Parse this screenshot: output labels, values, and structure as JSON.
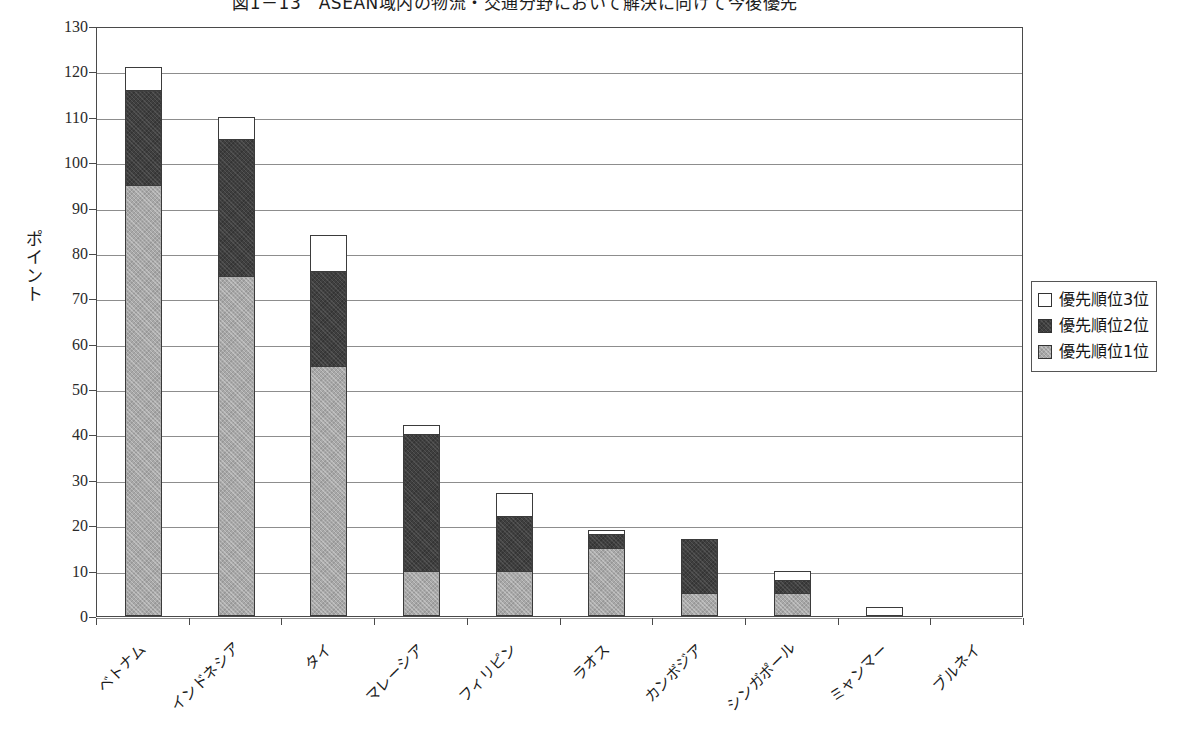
{
  "chart_data": {
    "type": "bar",
    "subtype": "stacked-bar",
    "title": "図1－13　ASEAN域内の物流・交通分野において解決に向けて今後優先",
    "ylabel": "ポイント",
    "xlabel": "",
    "ylim": [
      0,
      130
    ],
    "ytick_step": 10,
    "ytick_labels": [
      "130",
      "120",
      "110",
      "100",
      "90",
      "80",
      "70",
      "60",
      "50",
      "40",
      "30",
      "20",
      "10",
      "0"
    ],
    "grid": true,
    "legend_position": "right",
    "categories": [
      "ベトナム",
      "インドネシア",
      "タイ",
      "マレーシア",
      "フィリピン",
      "ラオス",
      "カンボジア",
      "シンガポール",
      "ミャンマー",
      "ブルネイ"
    ],
    "series": [
      {
        "name": "優先順位1位",
        "color": "#a8a8a8",
        "values": [
          95,
          75,
          55,
          10,
          10,
          15,
          5,
          5,
          0,
          0
        ]
      },
      {
        "name": "優先順位2位",
        "color": "#3f3f3f",
        "values": [
          21,
          30,
          21,
          30,
          12,
          3,
          12,
          3,
          0,
          0
        ]
      },
      {
        "name": "優先順位3位",
        "color": "#ffffff",
        "values": [
          5,
          5,
          8,
          2,
          5,
          1,
          0,
          2,
          2,
          0
        ]
      }
    ],
    "totals": [
      121,
      110,
      84,
      42,
      27,
      19,
      17,
      10,
      2,
      0
    ]
  },
  "legend": {
    "items": [
      {
        "label": "優先順位3位",
        "color": "#ffffff"
      },
      {
        "label": "優先順位2位",
        "color": "#3f3f3f"
      },
      {
        "label": "優先順位1位",
        "color": "#a8a8a8"
      }
    ]
  }
}
